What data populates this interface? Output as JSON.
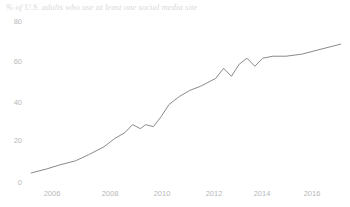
{
  "chart_data": {
    "type": "line",
    "title": "% of U.S. adults who use at least one social media site",
    "xlabel": "",
    "ylabel": "",
    "xlim": [
      2005.0,
      2017.1
    ],
    "ylim": [
      0,
      86
    ],
    "grid": false,
    "legend": null,
    "line_color": "#8a8a8a",
    "yticks": [
      0,
      20,
      40,
      60,
      80
    ],
    "ytick_labels": [
      "0",
      "20",
      "40",
      "60",
      "80"
    ],
    "xticks": [
      2006,
      2008,
      2010,
      2012,
      2014,
      2016
    ],
    "xtick_labels": [
      "2006",
      "2008",
      "2010",
      "2012",
      "2014",
      "2016"
    ],
    "series": [
      {
        "name": "% of U.S. adults who use at least one social media site",
        "x": [
          2005.2,
          2005.8,
          2006.3,
          2006.9,
          2007.4,
          2008.0,
          2008.4,
          2008.8,
          2009.1,
          2009.4,
          2009.6,
          2009.9,
          2010.2,
          2010.5,
          2010.9,
          2011.3,
          2011.7,
          2012.0,
          2012.3,
          2012.6,
          2012.9,
          2013.2,
          2013.5,
          2013.8,
          2014.1,
          2014.5,
          2015.0,
          2015.6,
          2016.2,
          2016.8,
          2017.1
        ],
        "y": [
          5,
          7,
          9,
          11,
          14,
          18,
          22,
          25,
          29,
          27,
          29,
          28,
          33,
          39,
          43,
          46,
          48,
          50,
          52,
          57,
          53,
          59,
          62,
          58,
          62,
          63,
          63,
          64,
          66,
          68,
          69
        ]
      }
    ]
  },
  "axis": {
    "ytick_positions_px": [
      183,
      141,
      103,
      62,
      22
    ],
    "xtick_positions_px": [
      52,
      110,
      162,
      214,
      262,
      312
    ]
  }
}
